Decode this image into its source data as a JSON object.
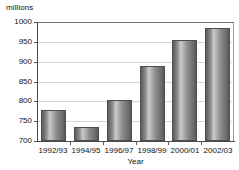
{
  "chart_data": {
    "type": "bar",
    "title": "",
    "xlabel": "Year",
    "ylabel": "millions",
    "categories": [
      "1992/93",
      "1994/95",
      "1996/97",
      "1998/99",
      "2000/01",
      "2002/03"
    ],
    "values": [
      777,
      735,
      803,
      889,
      955,
      985
    ],
    "ylim": [
      700,
      1000
    ],
    "ytick_labels": [
      "700",
      "750",
      "800",
      "850",
      "900",
      "950",
      "1000"
    ],
    "ytick_values": [
      700,
      750,
      800,
      850,
      900,
      950,
      1000
    ],
    "grid": true,
    "legend": null,
    "series_color": "#8d8d8d",
    "grid_color": "#d6d6d6",
    "axis_color": "#4a4a4a"
  },
  "axes": {
    "y_unit_label": "millions",
    "x_title": "Year"
  }
}
